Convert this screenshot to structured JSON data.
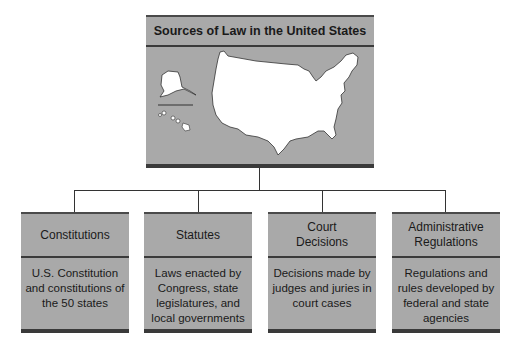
{
  "diagram": {
    "title": "Sources of Law in the United States",
    "map_icon": "us-map-icon",
    "sources": [
      {
        "title": "Constitutions",
        "description": "U.S. Constitution and constitutions of the 50 states"
      },
      {
        "title": "Statutes",
        "description": "Laws enacted by Congress, state legislatures, and local governments"
      },
      {
        "title": "Court Decisions",
        "description": "Decisions made by judges and juries in court cases"
      },
      {
        "title": "Administrative Regulations",
        "description": "Regulations and rules developed by federal and state agencies"
      }
    ],
    "colors": {
      "box_fill": "#a9a9a9",
      "rule": "#3a3a3a",
      "map_fill": "#ffffff"
    }
  }
}
